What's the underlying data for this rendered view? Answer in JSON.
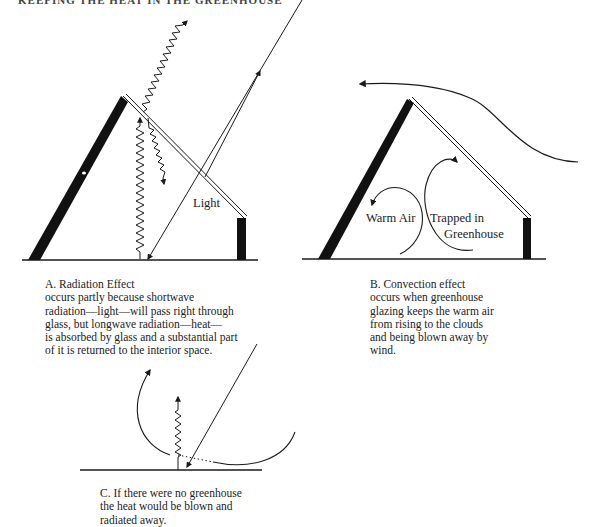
{
  "header": {
    "text": "KEEPING THE HEAT IN THE GREENHOUSE",
    "note": "clipped at top edge"
  },
  "panels": [
    {
      "id": "A",
      "title": "A.  Radiation Effect",
      "body": "occurs partly because shortwave\nradiation—light—will pass right through\nglass, but longwave radiation—heat—\nis absorbed by glass and a substantial part\nof it is returned to the interior space.",
      "labels": {
        "light": "Light"
      }
    },
    {
      "id": "B",
      "title": "B.  Convection effect",
      "body": "occurs when greenhouse\nglazing keeps the warm air\nfrom rising to the clouds\nand being blown away by\nwind.",
      "labels": {
        "warm_air": "Warm Air",
        "trapped_line1": "Trapped in",
        "trapped_line2": "Greenhouse"
      }
    },
    {
      "id": "C",
      "title": "C.  If there were no greenhouse",
      "body": "the heat would be blown and\nradiated away."
    }
  ],
  "colors": {
    "ink": "#1a1a1a",
    "background": "#ffffff"
  }
}
